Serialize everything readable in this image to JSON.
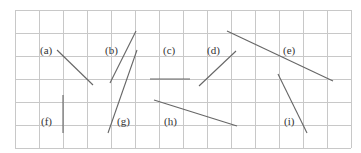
{
  "figure": {
    "grid": {
      "left": 15,
      "top": 10,
      "cols": 14,
      "rows": 6,
      "cell_w": 24,
      "cell_h": 23,
      "color": "#c8c8c8"
    },
    "line_color": "#666666",
    "segments": [
      {
        "id": "a",
        "label": "(a)",
        "label_pos": [
          40,
          45
        ],
        "x1": 57,
        "y1": 50,
        "x2": 93,
        "y2": 85
      },
      {
        "id": "b",
        "label": "(b)",
        "label_pos": [
          105,
          45
        ],
        "x1": 136,
        "y1": 31,
        "x2": 110,
        "y2": 83
      },
      {
        "id": "c",
        "label": "(c)",
        "label_pos": [
          163,
          45
        ],
        "x1": 150,
        "y1": 79,
        "x2": 190,
        "y2": 79
      },
      {
        "id": "d",
        "label": "(d)",
        "label_pos": [
          207,
          45
        ],
        "x1": 236,
        "y1": 51,
        "x2": 199,
        "y2": 86
      },
      {
        "id": "e",
        "label": "(e)",
        "label_pos": [
          283,
          45
        ],
        "x1": 227,
        "y1": 31,
        "x2": 333,
        "y2": 81
      },
      {
        "id": "f",
        "label": "(f)",
        "label_pos": [
          41,
          116
        ],
        "x1": 63,
        "y1": 95,
        "x2": 63,
        "y2": 133
      },
      {
        "id": "g",
        "label": "(g)",
        "label_pos": [
          117,
          116
        ],
        "x1": 137,
        "y1": 50,
        "x2": 108,
        "y2": 133
      },
      {
        "id": "h",
        "label": "(h)",
        "label_pos": [
          164,
          116
        ],
        "x1": 154,
        "y1": 100,
        "x2": 237,
        "y2": 126
      },
      {
        "id": "i",
        "label": "(i)",
        "label_pos": [
          284,
          116
        ],
        "x1": 278,
        "y1": 74,
        "x2": 307,
        "y2": 133
      }
    ]
  }
}
